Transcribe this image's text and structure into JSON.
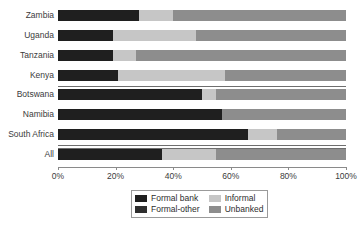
{
  "chart_data": {
    "type": "bar",
    "orientation": "horizontal",
    "stacked": true,
    "title": "",
    "subtitle": "",
    "xlabel": "",
    "ylabel": "",
    "xlim": [
      0,
      100
    ],
    "xticks": [
      0,
      20,
      40,
      60,
      80,
      100
    ],
    "xtick_labels": [
      "0%",
      "20%",
      "40%",
      "60%",
      "80%",
      "100%"
    ],
    "grid": false,
    "legend_position": "bottom",
    "categories": [
      "Zambia",
      "Uganda",
      "Tanzania",
      "Kenya",
      "Botswana",
      "Namibia",
      "South Africa",
      "All"
    ],
    "series": [
      {
        "name": "Formal bank",
        "color": "#1f1f1f",
        "values": [
          28,
          19,
          19,
          21,
          50,
          57,
          66,
          36
        ]
      },
      {
        "name": "Formal-other",
        "color": "#2f2f2f",
        "values": [
          0,
          0,
          0,
          0,
          0,
          0,
          0,
          0
        ]
      },
      {
        "name": "Informal",
        "color": "#c6c6c6",
        "values": [
          12,
          29,
          8,
          37,
          5,
          0,
          10,
          19
        ]
      },
      {
        "name": "Unbanked",
        "color": "#8d8d8d",
        "values": [
          60,
          52,
          73,
          42,
          45,
          43,
          24,
          45
        ]
      }
    ]
  },
  "axis": {
    "tick_labels": [
      "0%",
      "20%",
      "40%",
      "60%",
      "80%",
      "100%"
    ]
  },
  "categories": {
    "items": [
      {
        "label": "Zambia"
      },
      {
        "label": "Uganda"
      },
      {
        "label": "Tanzania"
      },
      {
        "label": "Kenya"
      },
      {
        "label": "Botswana"
      },
      {
        "label": "Namibia"
      },
      {
        "label": "South Africa"
      },
      {
        "label": "All"
      }
    ]
  },
  "legend": {
    "items": [
      {
        "label": "Formal bank",
        "color": "#1f1f1f"
      },
      {
        "label": "Informal",
        "color": "#c6c6c6"
      },
      {
        "label": "Formal-other",
        "color": "#2f2f2f"
      },
      {
        "label": "Unbanked",
        "color": "#8d8d8d"
      }
    ]
  },
  "colors": {
    "formal_bank": "#1f1f1f",
    "formal_other": "#2f2f2f",
    "informal": "#c6c6c6",
    "unbanked": "#8d8d8d",
    "axis": "#8a8a8a",
    "text": "#3b3b3b",
    "background": "#ffffff"
  }
}
